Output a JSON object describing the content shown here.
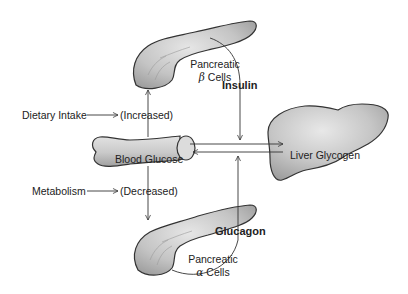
{
  "diagram": {
    "nodes": {
      "beta_cells": {
        "line1": "Pancreatic",
        "greek": "β",
        "line2": "Cells"
      },
      "alpha_cells": {
        "line1": "Pancreatic",
        "greek": "α",
        "line2": "Cells"
      },
      "blood_glucose": {
        "label": "Blood Glucose"
      },
      "liver": {
        "label": "Liver Glycogen"
      }
    },
    "inputs": {
      "dietary_intake": {
        "label": "Dietary Intake",
        "effect": "(Increased)"
      },
      "metabolism": {
        "label": "Metabolism",
        "effect": "(Decreased)"
      }
    },
    "hormones": {
      "insulin": "Insulin",
      "glucagon": "Glucagon"
    },
    "colors": {
      "organ_fill_light": "#e4e4e4",
      "organ_fill_dark": "#a9a9a9",
      "stroke": "#333333",
      "text": "#222222"
    }
  }
}
